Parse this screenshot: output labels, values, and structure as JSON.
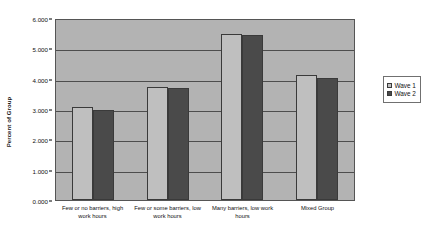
{
  "chart_data": {
    "type": "bar",
    "title": "",
    "xlabel": "",
    "ylabel": "Percent of Group",
    "ylim": [
      0,
      6
    ],
    "grid": true,
    "legend_position": "right",
    "categories": [
      "Few or no barriers, high work hours",
      "Few or some barriers, low work hours",
      "Many barriers, low work hours",
      "Mixed Group"
    ],
    "ytick_labels": [
      "6.000",
      "5.000",
      "4.000",
      "3.000",
      "2.000",
      "1.000",
      "0.000"
    ],
    "ytick_values": [
      6,
      5,
      4,
      3,
      2,
      1,
      0
    ],
    "series": [
      {
        "name": "Wave 1",
        "color": "#bfbfbf",
        "values": [
          3.07,
          3.73,
          5.48,
          4.13
        ]
      },
      {
        "name": "Wave 2",
        "color": "#4a4a4a",
        "values": [
          2.97,
          3.7,
          5.45,
          4.03
        ]
      }
    ],
    "plot_background": "#b3b3b3",
    "gridline_color": "#4d4d4d"
  }
}
